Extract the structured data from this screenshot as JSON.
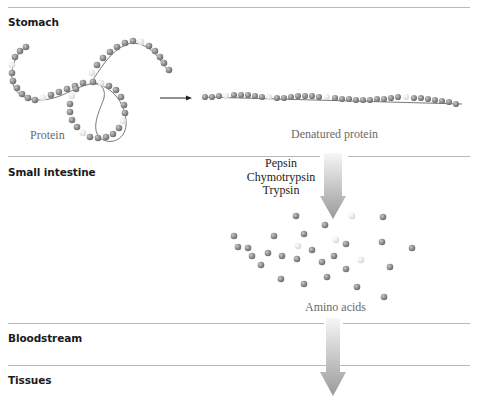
{
  "sections": [
    {
      "label": "Stomach"
    },
    {
      "label": "Small intestine"
    },
    {
      "label": "Bloodstream"
    },
    {
      "label": "Tissues"
    }
  ],
  "captions": {
    "protein": "Protein",
    "denatured_protein": "Denatured protein",
    "amino_acids": "Amino acids"
  },
  "enzymes": [
    "Pepsin",
    "Chymotrypsin",
    "Trypsin"
  ],
  "colors": {
    "bead": "#8e8e8e",
    "bead_light": "#e6e6e6",
    "rule": "#b8b8b8",
    "arrow_top": "#f4f4f4",
    "arrow_bottom": "#9c9c9c"
  }
}
